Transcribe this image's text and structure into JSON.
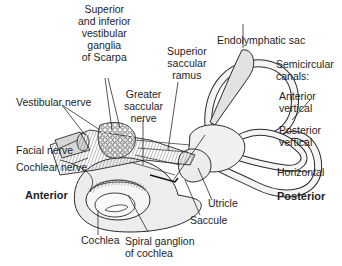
{
  "figure": {
    "orientation": {
      "left": "Anterior",
      "right": "Posterior"
    }
  },
  "labels": {
    "scarpa": [
      "Superior",
      "and inferior",
      "vestibular",
      "ganglia",
      "of Scarpa"
    ],
    "superior_saccular_ramus": [
      "Superior",
      "saccular",
      "ramus"
    ],
    "endolymphatic_sac": "Endolymphatic sac",
    "semicircular_canals": [
      "Semicircular",
      "canals:"
    ],
    "anterior_vertical": [
      "Anterior",
      "vertical"
    ],
    "posterior_vertical": [
      "Posterior",
      "vertical"
    ],
    "horizontal": "Horizontal",
    "vestibular_nerve": "Vestibular nerve",
    "greater_saccular_nerve": [
      "Greater",
      "saccular",
      "nerve"
    ],
    "facial_nerve": "Facial nerve",
    "cochlear_nerve": "Cochlear nerve",
    "anterior": "Anterior",
    "posterior": "Posterior",
    "utricle": "Utricle",
    "saccule": "Saccule",
    "cochlea": "Cochlea",
    "spiral_ganglion": [
      "Spiral ganglion",
      "of cochlea"
    ]
  },
  "colors": {
    "line": "#2a2a2a",
    "fill_light": "#eeeeee",
    "fill_mid": "#d6d6d6",
    "fill_dark": "#9a9a9a",
    "background": "#ffffff"
  }
}
